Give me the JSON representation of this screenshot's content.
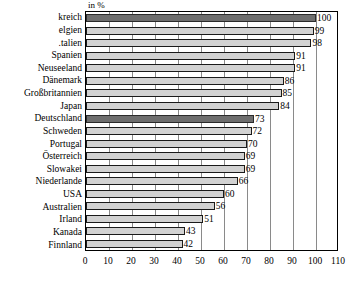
{
  "chart_data": {
    "type": "bar",
    "orientation": "horizontal",
    "title": "",
    "unit_label": "in %",
    "xlabel": "",
    "ylabel": "",
    "xlim": [
      0,
      110
    ],
    "xticks": [
      "0",
      "10",
      "20",
      "30",
      "40",
      "50",
      "60",
      "70",
      "80",
      "90",
      "100",
      "110"
    ],
    "grid": true,
    "legend": false,
    "categories": [
      "kreich",
      "elgien",
      ".talien",
      "Spanien",
      "Neuseeland",
      "Dänemark",
      "Großbritannien",
      "Japan",
      "Deutschland",
      "Schweden",
      "Portugal",
      "Österreich",
      "Slowakei",
      "Niederlande",
      "USA",
      "Australien",
      "Irland",
      "Kanada",
      "Finnland"
    ],
    "values": [
      100,
      99,
      98,
      91,
      91,
      86,
      85,
      84,
      73,
      72,
      70,
      69,
      69,
      66,
      60,
      56,
      51,
      43,
      42
    ],
    "value_labels": [
      "100",
      "99",
      "98",
      "91",
      "91",
      "86",
      "85",
      "84",
      "73",
      "72",
      "70",
      "69",
      "69",
      "66",
      "60",
      "56",
      "51",
      "43",
      "42"
    ],
    "highlighted": [
      true,
      false,
      false,
      false,
      false,
      false,
      false,
      false,
      true,
      false,
      false,
      false,
      false,
      false,
      false,
      false,
      false,
      false,
      false
    ],
    "colors": {
      "bar_fill": "#d2d2d2",
      "bar_highlight_fill": "#6e6e6e",
      "bar_border": "#1a1a1a",
      "gridline": "#8a8a8a",
      "frame": "#000000",
      "text": "#000000",
      "background": "#ffffff"
    }
  }
}
